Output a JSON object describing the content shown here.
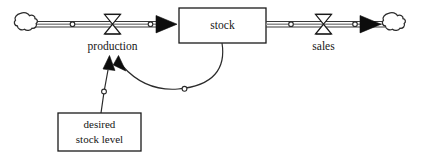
{
  "diagram": {
    "type": "system-dynamics-stock-flow",
    "background_color": "#ffffff",
    "line_color": "#1a1a1a",
    "fill_color": "#ffffff",
    "nodes": {
      "source_cloud": {
        "name": "source-cloud",
        "label": ""
      },
      "sink_cloud": {
        "name": "sink-cloud",
        "label": ""
      },
      "stock": {
        "label": "stock"
      },
      "production_valve": {
        "label": "production"
      },
      "sales_valve": {
        "label": "sales"
      },
      "desired_stock_level": {
        "label_line1": "desired",
        "label_line2": "stock level"
      }
    },
    "flows": [
      {
        "name": "inflow",
        "from": "source-cloud",
        "to": "stock",
        "valve": "production"
      },
      {
        "name": "outflow",
        "from": "stock",
        "to": "sink-cloud",
        "valve": "sales"
      }
    ],
    "links": [
      {
        "name": "stock-to-production-link",
        "from": "stock",
        "to": "production"
      },
      {
        "name": "desired-stock-level-to-production-link",
        "from": "desired stock level",
        "to": "production"
      }
    ]
  }
}
